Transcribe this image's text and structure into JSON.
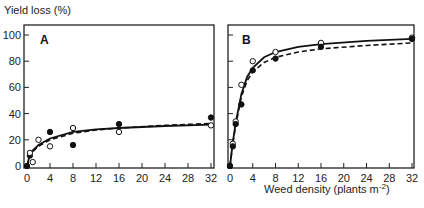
{
  "chart_data": [
    {
      "type": "scatter",
      "panel": "A",
      "title": "",
      "xlabel": "",
      "ylabel": "Yield loss (%)",
      "xlim": [
        0,
        32
      ],
      "ylim": [
        0,
        100
      ],
      "xticks": [
        0,
        4,
        8,
        12,
        16,
        20,
        24,
        28,
        32
      ],
      "yticks": [
        0,
        20,
        40,
        60,
        80,
        100
      ],
      "grid": false,
      "series": [
        {
          "name": "filled circles (solid curve)",
          "marker": "filled",
          "line": "solid",
          "points": [
            [
              0,
              0
            ],
            [
              0.5,
              8
            ],
            [
              4,
              26
            ],
            [
              8,
              16
            ],
            [
              16,
              32
            ],
            [
              32,
              37
            ]
          ],
          "curve": [
            [
              0,
              0
            ],
            [
              0.5,
              9
            ],
            [
              1,
              12
            ],
            [
              2,
              16
            ],
            [
              4,
              21
            ],
            [
              8,
              26
            ],
            [
              12,
              28
            ],
            [
              16,
              29
            ],
            [
              24,
              30.5
            ],
            [
              32,
              31.5
            ]
          ]
        },
        {
          "name": "open circles (dashed curve)",
          "marker": "open",
          "line": "dashed",
          "points": [
            [
              0.5,
              10
            ],
            [
              1,
              3
            ],
            [
              2,
              20
            ],
            [
              4,
              15
            ],
            [
              8,
              29
            ],
            [
              16,
              26
            ],
            [
              32,
              31
            ]
          ],
          "curve": [
            [
              0,
              0
            ],
            [
              0.5,
              8
            ],
            [
              1,
              11
            ],
            [
              2,
              15
            ],
            [
              4,
              20
            ],
            [
              8,
              25
            ],
            [
              12,
              27.5
            ],
            [
              16,
              29
            ],
            [
              24,
              31
            ],
            [
              32,
              32.5
            ]
          ]
        }
      ]
    },
    {
      "type": "scatter",
      "panel": "B",
      "title": "",
      "xlabel": "Weed density (plants m-2)",
      "ylabel": "",
      "xlim": [
        0,
        32
      ],
      "ylim": [
        0,
        100
      ],
      "xticks": [
        0,
        4,
        8,
        12,
        16,
        20,
        24,
        28,
        32
      ],
      "yticks": [
        0,
        20,
        40,
        60,
        80,
        100
      ],
      "grid": false,
      "series": [
        {
          "name": "open circles (solid curve)",
          "marker": "open",
          "line": "solid",
          "points": [
            [
              0,
              0
            ],
            [
              0.5,
              17
            ],
            [
              1,
              34
            ],
            [
              2,
              62
            ],
            [
              4,
              80
            ],
            [
              8,
              87
            ],
            [
              16,
              94
            ],
            [
              32,
              98
            ]
          ],
          "curve": [
            [
              0,
              0
            ],
            [
              0.5,
              18
            ],
            [
              1,
              33
            ],
            [
              2,
              55
            ],
            [
              3,
              68
            ],
            [
              4,
              75
            ],
            [
              6,
              83
            ],
            [
              8,
              87
            ],
            [
              12,
              91
            ],
            [
              16,
              93
            ],
            [
              24,
              95.5
            ],
            [
              32,
              97
            ]
          ]
        },
        {
          "name": "filled circles (dashed curve)",
          "marker": "filled",
          "line": "dashed",
          "points": [
            [
              0,
              0
            ],
            [
              0.5,
              15
            ],
            [
              1,
              32
            ],
            [
              2,
              47
            ],
            [
              4,
              73
            ],
            [
              8,
              82
            ],
            [
              16,
              91
            ],
            [
              32,
              97
            ]
          ],
          "curve": [
            [
              0,
              0
            ],
            [
              0.5,
              17
            ],
            [
              1,
              31
            ],
            [
              2,
              53
            ],
            [
              3,
              65
            ],
            [
              4,
              72
            ],
            [
              6,
              79
            ],
            [
              8,
              83
            ],
            [
              12,
              87
            ],
            [
              16,
              89.5
            ],
            [
              24,
              92
            ],
            [
              32,
              94
            ]
          ]
        }
      ]
    }
  ],
  "labels": {
    "ylabel": "Yield loss (%)",
    "panel_a": "A",
    "panel_b": "B",
    "xlabel_main": "Weed density (plants m",
    "xlabel_sup": "-2",
    "xlabel_close": ")"
  }
}
